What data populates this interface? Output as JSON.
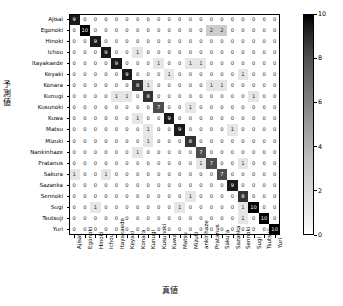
{
  "axes": {
    "ylabel": "予測値",
    "ylabel_chars": [
      "予",
      "測",
      "値"
    ],
    "xlabel": "真値"
  },
  "colorbar": {
    "ticks": [
      "0",
      "2",
      "4",
      "6",
      "8",
      "10"
    ],
    "vmin": 0,
    "vmax": 10,
    "cmap_low": "#ffffff",
    "cmap_high": "#000000"
  },
  "chart_data": {
    "type": "heatmap",
    "title": "",
    "xlabel": "真値",
    "ylabel": "予測値",
    "grid": false,
    "legend": "colorbar-right",
    "vmin": 0,
    "vmax": 10,
    "colorbar_ticks": [
      0,
      2,
      4,
      6,
      8,
      10
    ],
    "x_categories": [
      "Ajisai",
      "Egonoki",
      "Hinoki",
      "Ichou",
      "Itayakaede",
      "Keyaki",
      "Konara",
      "Kunugi",
      "Kusunoki",
      "Kuwa",
      "Matsu",
      "Mizuki",
      "ankinhaze",
      "Pratanus",
      "Sakura",
      "Sazanka",
      "Sennoki",
      "Sugi",
      "Tsutsuji",
      "Yuri"
    ],
    "y_categories": [
      "Ajisai",
      "Egonoki",
      "Hinoki",
      "Ichou",
      "Itayakaede",
      "Keyaki",
      "Konara",
      "Kunugi",
      "Kusunoki",
      "Kuwa",
      "Matsu",
      "Mizuki",
      "Nankinhaze",
      "Pratanus",
      "Sakura",
      "Sazanka",
      "Sennoki",
      "Sugi",
      "Tsutsuji",
      "Yuri"
    ],
    "values": [
      [
        9,
        0,
        0,
        0,
        0,
        0,
        0,
        0,
        0,
        0,
        0,
        0,
        0,
        0,
        0,
        0,
        0,
        0,
        0,
        0
      ],
      [
        0,
        10,
        0,
        0,
        0,
        0,
        0,
        0,
        0,
        0,
        0,
        0,
        0,
        2,
        2,
        0,
        0,
        0,
        0,
        0
      ],
      [
        0,
        0,
        9,
        0,
        0,
        0,
        0,
        0,
        0,
        0,
        0,
        0,
        0,
        0,
        0,
        0,
        0,
        0,
        0,
        0
      ],
      [
        0,
        0,
        0,
        9,
        0,
        0,
        1,
        0,
        0,
        0,
        0,
        0,
        0,
        0,
        0,
        0,
        0,
        0,
        0,
        0
      ],
      [
        0,
        0,
        0,
        0,
        9,
        0,
        0,
        0,
        1,
        0,
        0,
        1,
        1,
        0,
        0,
        0,
        0,
        0,
        0,
        0
      ],
      [
        0,
        0,
        0,
        0,
        0,
        9,
        0,
        0,
        0,
        1,
        0,
        0,
        0,
        0,
        0,
        0,
        1,
        0,
        0,
        0
      ],
      [
        0,
        0,
        0,
        0,
        0,
        0,
        8,
        1,
        0,
        0,
        0,
        0,
        0,
        1,
        1,
        0,
        0,
        0,
        0,
        0
      ],
      [
        0,
        0,
        0,
        0,
        1,
        1,
        0,
        8,
        0,
        0,
        0,
        0,
        0,
        0,
        0,
        0,
        0,
        1,
        0,
        0
      ],
      [
        0,
        0,
        0,
        0,
        0,
        0,
        0,
        0,
        7,
        0,
        0,
        1,
        0,
        0,
        0,
        0,
        0,
        0,
        0,
        0
      ],
      [
        0,
        0,
        0,
        0,
        0,
        0,
        1,
        0,
        0,
        9,
        0,
        0,
        0,
        0,
        0,
        0,
        0,
        0,
        0,
        0
      ],
      [
        0,
        0,
        0,
        0,
        0,
        0,
        0,
        1,
        0,
        0,
        9,
        0,
        0,
        0,
        0,
        1,
        0,
        0,
        0,
        0
      ],
      [
        0,
        0,
        0,
        0,
        0,
        0,
        0,
        1,
        0,
        0,
        0,
        8,
        0,
        0,
        0,
        0,
        0,
        0,
        0,
        0
      ],
      [
        0,
        0,
        0,
        0,
        0,
        0,
        1,
        0,
        0,
        0,
        0,
        0,
        7,
        0,
        0,
        0,
        0,
        0,
        0,
        0
      ],
      [
        0,
        0,
        0,
        0,
        0,
        0,
        0,
        0,
        0,
        0,
        0,
        0,
        1,
        7,
        0,
        0,
        1,
        0,
        0,
        0
      ],
      [
        1,
        0,
        0,
        1,
        0,
        0,
        0,
        0,
        0,
        0,
        0,
        0,
        0,
        0,
        7,
        0,
        0,
        0,
        0,
        0
      ],
      [
        0,
        0,
        0,
        0,
        0,
        0,
        0,
        0,
        0,
        0,
        0,
        0,
        0,
        0,
        0,
        9,
        0,
        0,
        0,
        0
      ],
      [
        0,
        0,
        0,
        0,
        0,
        0,
        0,
        0,
        0,
        0,
        0,
        1,
        0,
        0,
        0,
        0,
        8,
        0,
        0,
        0
      ],
      [
        0,
        0,
        1,
        0,
        0,
        0,
        0,
        0,
        0,
        0,
        1,
        0,
        0,
        0,
        0,
        0,
        1,
        10,
        0,
        0
      ],
      [
        0,
        0,
        0,
        0,
        0,
        0,
        0,
        0,
        0,
        0,
        0,
        0,
        0,
        0,
        0,
        0,
        1,
        0,
        10,
        0
      ],
      [
        0,
        0,
        0,
        0,
        0,
        0,
        0,
        0,
        0,
        0,
        0,
        0,
        0,
        0,
        0,
        0,
        0,
        0,
        0,
        10
      ]
    ]
  }
}
